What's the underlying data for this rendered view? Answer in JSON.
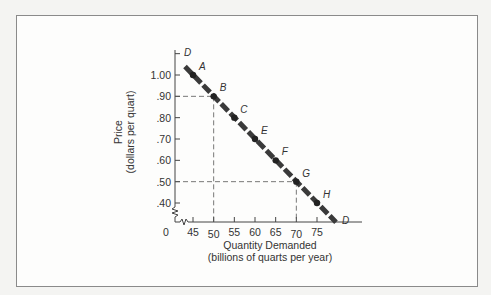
{
  "chart_data": {
    "type": "line",
    "title": "",
    "xlabel": "Quantity Demanded",
    "xlabel_sub": "(billions of quarts per year)",
    "ylabel": "Price",
    "ylabel_sub": "(dollars per quart)",
    "x_origin_label": "0",
    "x_ticks": [
      "45",
      "50",
      "55",
      "60",
      "65",
      "70",
      "75"
    ],
    "y_ticks": [
      "1.00",
      ".90",
      ".80",
      ".70",
      ".60",
      ".50",
      ".40"
    ],
    "xlim": [
      40,
      80
    ],
    "ylim": [
      0.35,
      1.1
    ],
    "axis_break": true,
    "series": [
      {
        "name": "D",
        "line_label_start": "D",
        "line_label_end": "D",
        "points": [
          {
            "label": "A",
            "x": 45,
            "y": 1.0
          },
          {
            "label": "B",
            "x": 50,
            "y": 0.9
          },
          {
            "label": "C",
            "x": 55,
            "y": 0.8
          },
          {
            "label": "E",
            "x": 60,
            "y": 0.7
          },
          {
            "label": "F",
            "x": 65,
            "y": 0.6
          },
          {
            "label": "G",
            "x": 70,
            "y": 0.5
          },
          {
            "label": "H",
            "x": 75,
            "y": 0.4
          }
        ]
      }
    ],
    "reference_lines": [
      {
        "from_point": "B",
        "x": 50,
        "y": 0.9,
        "style": "dashed"
      },
      {
        "from_point": "G",
        "x": 70,
        "y": 0.5,
        "style": "dashed"
      }
    ],
    "grid": false,
    "legend": "none"
  }
}
